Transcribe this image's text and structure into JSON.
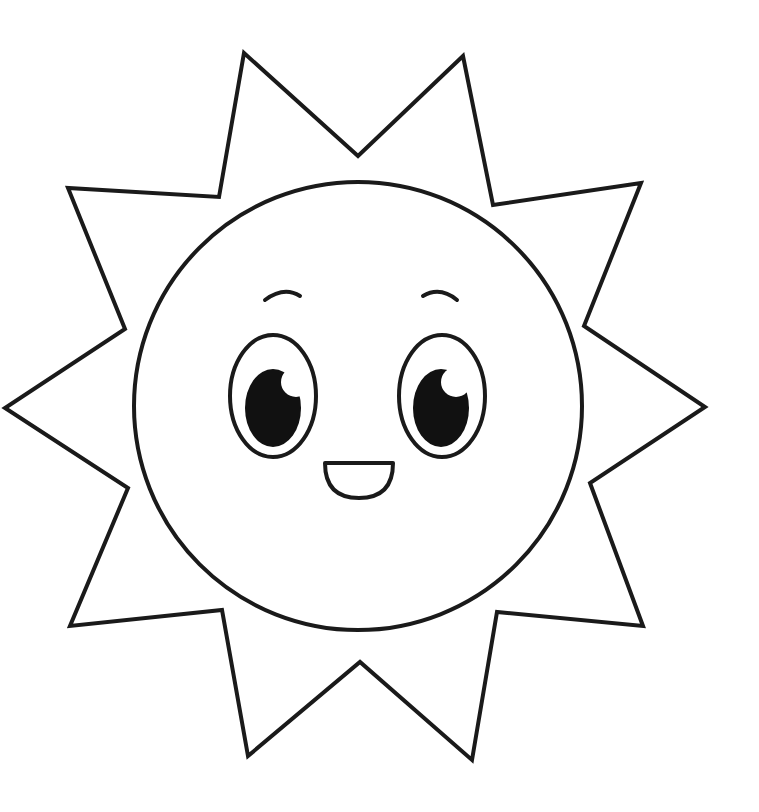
{
  "image": {
    "subject": "smiling sun coloring page",
    "width": 759,
    "height": 812,
    "background": "#ffffff",
    "stroke_color": "#1a1a1a",
    "fill_color": "#111111"
  },
  "rays": {
    "points": "244,53 358,156 463,56 493,205 641,183 584,326 705,407 590,483 643,626 497,612 472,760 360,662 248,756 222,610 70,626 128,488 5,408 125,329 68,188 219,197"
  },
  "face": {
    "cx": 358,
    "cy": 406,
    "r": 224
  },
  "eyes": [
    {
      "cx": 273,
      "cy": 396,
      "rx": 43,
      "ry": 61,
      "pupil_cx": 273,
      "pupil_cy": 408,
      "pupil_rx": 28,
      "pupil_ry": 39,
      "highlight_cx": 296,
      "highlight_cy": 382,
      "highlight_r": 15
    },
    {
      "cx": 442,
      "cy": 396,
      "rx": 43,
      "ry": 61,
      "pupil_cx": 441,
      "pupil_cy": 408,
      "pupil_rx": 28,
      "pupil_ry": 39,
      "highlight_cx": 456,
      "highlight_cy": 382,
      "highlight_r": 15
    }
  ],
  "brows": [
    {
      "d": "M 265 300 Q 284 286 300 296"
    },
    {
      "d": "M 423 296 Q 440 286 457 300"
    }
  ],
  "mouth": {
    "d": "M 325 463 L 393 463 Q 393 498 359 498 Q 325 498 325 463 Z"
  }
}
